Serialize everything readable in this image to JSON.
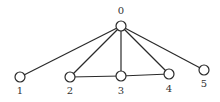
{
  "diagram": {
    "type": "graph",
    "nodes": [
      {
        "id": "0",
        "label": "0",
        "x": 121,
        "y": 26,
        "lx": 121,
        "ly": 14
      },
      {
        "id": "1",
        "label": "1",
        "x": 20,
        "y": 77,
        "lx": 20,
        "ly": 94
      },
      {
        "id": "2",
        "label": "2",
        "x": 70,
        "y": 77,
        "lx": 70,
        "ly": 94
      },
      {
        "id": "3",
        "label": "3",
        "x": 121,
        "y": 76,
        "lx": 121,
        "ly": 94
      },
      {
        "id": "4",
        "label": "4",
        "x": 169,
        "y": 74,
        "lx": 169,
        "ly": 92
      },
      {
        "id": "5",
        "label": "5",
        "x": 204,
        "y": 70,
        "lx": 204,
        "ly": 87
      }
    ],
    "edges": [
      {
        "from": "0",
        "to": "1"
      },
      {
        "from": "0",
        "to": "2"
      },
      {
        "from": "0",
        "to": "3"
      },
      {
        "from": "0",
        "to": "4"
      },
      {
        "from": "0",
        "to": "5"
      },
      {
        "from": "2",
        "to": "3"
      },
      {
        "from": "3",
        "to": "4"
      }
    ],
    "node_radius": 5,
    "colors": {
      "stroke": "#2a2a2a",
      "fill": "#ffffff",
      "label": "#333333"
    }
  }
}
